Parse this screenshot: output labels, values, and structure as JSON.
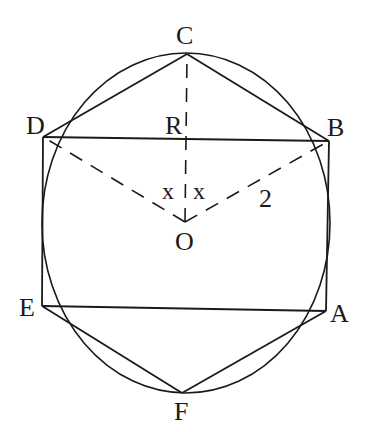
{
  "diagram": {
    "colors": {
      "stroke": "#1a1a1a",
      "background": "#ffffff"
    },
    "circle": {
      "center": [
        186,
        223
      ],
      "rx": 169,
      "ry": 170
    },
    "points": {
      "A": [
        326,
        311
      ],
      "B": [
        329,
        141
      ],
      "C": [
        187,
        54
      ],
      "D": [
        43,
        137
      ],
      "E": [
        42,
        306
      ],
      "F": [
        182,
        393
      ],
      "O": [
        185,
        222
      ]
    },
    "labels": {
      "A": "A",
      "B": "B",
      "C": "C",
      "D": "D",
      "E": "E",
      "F": "F",
      "O": "O",
      "R": "R",
      "angle_left": "x",
      "angle_right": "x",
      "radius_value": "2"
    },
    "solid_segments": [
      "C-D",
      "C-B",
      "D-B",
      "D-E",
      "B-A",
      "E-A",
      "E-F",
      "F-A"
    ],
    "dashed_segments": [
      "O-C",
      "O-D",
      "O-B"
    ]
  }
}
